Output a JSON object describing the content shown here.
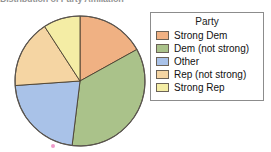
{
  "chart_data": {
    "type": "pie",
    "title": "Distribution of Party Affiliation",
    "title_visible": "partial-cropped-top",
    "categories": [
      "Strong Dem",
      "Dem (not strong)",
      "Other",
      "Rep (not strong)",
      "Strong Rep"
    ],
    "values": [
      17,
      35,
      22,
      17,
      9
    ],
    "units": "percent",
    "start_angle_deg": 0,
    "direction": "clockwise",
    "legend": {
      "title": "Party",
      "position": "right",
      "entries": [
        {
          "label": "Strong Dem",
          "color": "#f0b183"
        },
        {
          "label": "Dem (not strong)",
          "color": "#aac28a"
        },
        {
          "label": "Other",
          "color": "#a9c2e8"
        },
        {
          "label": "Rep (not strong)",
          "color": "#f5d5a3"
        },
        {
          "label": "Strong Rep",
          "color": "#f4eda5"
        }
      ]
    },
    "slices": [
      {
        "label": "Strong Dem",
        "value": 17,
        "color": "#f0b183",
        "start_deg": 0,
        "end_deg": 61
      },
      {
        "label": "Dem (not strong)",
        "value": 35,
        "color": "#aac28a",
        "start_deg": 61,
        "end_deg": 187
      },
      {
        "label": "Other",
        "value": 22,
        "color": "#a9c2e8",
        "start_deg": 187,
        "end_deg": 266
      },
      {
        "label": "Rep (not strong)",
        "value": 17,
        "color": "#f5d5a3",
        "start_deg": 266,
        "end_deg": 327
      },
      {
        "label": "Strong Rep",
        "value": 9,
        "color": "#f4eda5",
        "start_deg": 327,
        "end_deg": 360
      }
    ],
    "grid": false,
    "xlabel": "",
    "ylabel": ""
  },
  "geometry": {
    "center_x": 80,
    "center_y": 81,
    "radius": 65
  },
  "colors": {
    "slice_outline": "#4a4030",
    "pie_outline": "#5a5550",
    "legend_border": "#8c8c8c",
    "legend_background": "#ffffff",
    "page_background": "#ffffff",
    "marker": "#e87ab8"
  },
  "artifacts": {
    "marker_name": "scan-speck"
  }
}
